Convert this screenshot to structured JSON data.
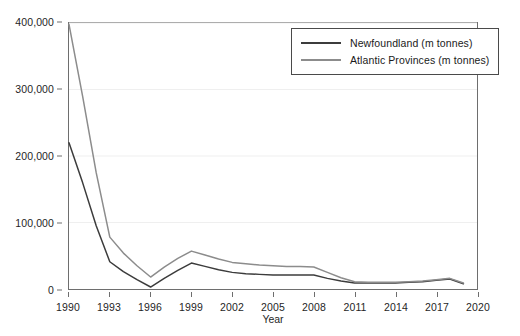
{
  "chart_data": {
    "type": "line",
    "title": "",
    "xlabel": "Year",
    "ylabel": "",
    "xlim": [
      1990,
      2020
    ],
    "ylim": [
      0,
      400000
    ],
    "grid": true,
    "grid_axis": "y",
    "legend_position": "top-right",
    "x_ticks": [
      1990,
      1993,
      1996,
      1999,
      2002,
      2005,
      2008,
      2011,
      2014,
      2017,
      2020
    ],
    "x_tick_labels": [
      "1990",
      "1993",
      "1996",
      "1999",
      "2002",
      "2005",
      "2008",
      "2011",
      "2014",
      "2017",
      "2020"
    ],
    "y_ticks": [
      0,
      100000,
      200000,
      300000,
      400000
    ],
    "y_tick_labels": [
      "0",
      "100,000",
      "200,000",
      "300,000",
      "400,000"
    ],
    "x": [
      1990,
      1991,
      1992,
      1993,
      1994,
      1995,
      1996,
      1997,
      1998,
      1999,
      2000,
      2001,
      2002,
      2003,
      2004,
      2005,
      2006,
      2007,
      2008,
      2009,
      2010,
      2011,
      2012,
      2013,
      2014,
      2015,
      2016,
      2017,
      2018,
      2019
    ],
    "series": [
      {
        "name": "Newfoundland (m tonnes)",
        "color": "#3c3c3c",
        "values": [
          220000,
          160000,
          95000,
          41000,
          26000,
          14000,
          3000,
          16000,
          28000,
          39000,
          34000,
          29000,
          25000,
          23000,
          22000,
          21000,
          21000,
          21000,
          21000,
          16000,
          12000,
          9000,
          9000,
          9000,
          9000,
          10000,
          11000,
          13000,
          15000,
          8000
        ]
      },
      {
        "name": "Atlantic Provinces (m tonnes)",
        "color": "#8c8c8c",
        "values": [
          398000,
          290000,
          175000,
          78000,
          54000,
          35000,
          18000,
          33000,
          46000,
          57000,
          51000,
          45000,
          40000,
          38000,
          36000,
          35000,
          34000,
          34000,
          33000,
          25000,
          17000,
          11000,
          10000,
          10000,
          10000,
          11000,
          12000,
          14000,
          16000,
          9000
        ]
      }
    ]
  },
  "legend": {
    "entries": [
      {
        "label": "Newfoundland (m tonnes)",
        "color": "#3c3c3c"
      },
      {
        "label": "Atlantic Provinces (m tonnes)",
        "color": "#8c8c8c"
      }
    ]
  },
  "style": {
    "grid_color": "#efefef",
    "axis_color": "#6e6e6e",
    "background": "#ffffff"
  }
}
